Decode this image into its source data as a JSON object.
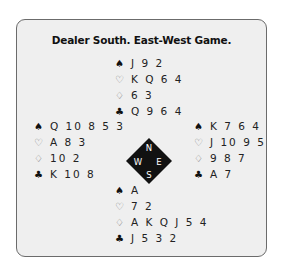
{
  "title": "Dealer South. East-West Game.",
  "suits": {
    "spades": "♠",
    "hearts": "♡",
    "diamonds": "♢",
    "clubs": "♣"
  },
  "compass": {
    "north": "N",
    "south": "S",
    "east": "E",
    "west": "W",
    "color": "#111111"
  },
  "hands": {
    "north": {
      "spades": "J 9 2",
      "hearts": "K Q 6 4",
      "diamonds": "6 3",
      "clubs": "Q 9 6 4"
    },
    "west": {
      "spades": "Q 10 8 5 3",
      "hearts": "A 8 3",
      "diamonds": "10 2",
      "clubs": "K 10 8"
    },
    "east": {
      "spades": "K 7 6 4",
      "hearts": "J 10 9 5",
      "diamonds": "9 8 7",
      "clubs": "A 7"
    },
    "south": {
      "spades": "A",
      "hearts": "7 2",
      "diamonds": "A K Q J 5 4",
      "clubs": "J 5 3 2"
    }
  }
}
